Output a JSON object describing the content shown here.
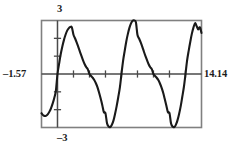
{
  "plot": {
    "title": "",
    "labels": {
      "y_max": "3",
      "y_min": "–3",
      "x_min": "–1.57",
      "x_max": "14.14"
    },
    "colors": {
      "background": "#ffffff",
      "frame": "#808080",
      "axis": "#4a4a4a",
      "curve": "#1a1a1a",
      "text": "#1c1c1c"
    }
  },
  "chart_data": {
    "type": "line",
    "title": "",
    "xlabel": "",
    "ylabel": "",
    "xlim": [
      -1.57,
      14.14
    ],
    "ylim": [
      -3,
      3
    ],
    "grid": false,
    "legend": null,
    "axis_ticks": {
      "x_tick_spacing": 1.5707963,
      "y_tick_spacing": 1,
      "x_ticks": [
        0.0,
        1.5708,
        3.1416,
        4.7124,
        6.2832,
        7.854,
        9.4248,
        10.9956,
        12.5664,
        14.1372
      ],
      "y_ticks": [
        -2,
        -1,
        1,
        2
      ]
    },
    "series": [
      {
        "name": "curve",
        "expression": "2.2*sin(x) + 0.75*sin(2*x)",
        "x": [
          -1.57,
          -1.41,
          -1.26,
          -1.1,
          -0.94,
          -0.79,
          -0.63,
          -0.47,
          -0.31,
          -0.16,
          0.0,
          0.16,
          0.31,
          0.47,
          0.63,
          0.79,
          0.94,
          1.1,
          1.26,
          1.41,
          1.57,
          1.73,
          1.88,
          2.04,
          2.2,
          2.36,
          2.51,
          2.67,
          2.83,
          2.98,
          3.14,
          3.3,
          3.46,
          3.61,
          3.77,
          3.93,
          4.08,
          4.24,
          4.4,
          4.55,
          4.71,
          4.87,
          5.03,
          5.18,
          5.34,
          5.5,
          5.65,
          5.81,
          5.97,
          6.13,
          6.28,
          6.44,
          6.6,
          6.75,
          6.91,
          7.07,
          7.23,
          7.38,
          7.54,
          7.7,
          7.85,
          8.01,
          8.17,
          8.33,
          8.48,
          8.64,
          8.8,
          8.95,
          9.11,
          9.27,
          9.42,
          9.58,
          9.74,
          9.9,
          10.05,
          10.21,
          10.37,
          10.52,
          10.68,
          10.84,
          11.0,
          11.15,
          11.31,
          11.47,
          11.62,
          11.78,
          11.94,
          12.1,
          12.25,
          12.41,
          12.57,
          12.72,
          12.88,
          13.04,
          13.19,
          13.35,
          13.51,
          13.67,
          13.82,
          13.98,
          14.14
        ],
        "y": [
          -2.2,
          -2.31,
          -2.35,
          -2.33,
          -2.25,
          -2.11,
          -1.91,
          -1.65,
          -1.33,
          -0.95,
          0.0,
          0.58,
          1.09,
          1.53,
          1.9,
          2.2,
          2.42,
          2.56,
          2.63,
          2.62,
          2.2,
          1.99,
          1.77,
          1.52,
          1.26,
          1.0,
          0.76,
          0.55,
          0.38,
          0.26,
          0.0,
          -0.11,
          -0.21,
          -0.34,
          -0.52,
          -0.75,
          -1.04,
          -1.38,
          -1.75,
          -2.14,
          -2.2,
          -2.78,
          -2.95,
          -2.97,
          -2.85,
          -2.6,
          -2.24,
          -1.8,
          -1.29,
          -0.73,
          0.0,
          0.74,
          1.3,
          1.81,
          2.25,
          2.6,
          2.85,
          2.99,
          3.0,
          2.9,
          2.2,
          1.99,
          1.77,
          1.52,
          1.26,
          1.0,
          0.76,
          0.55,
          0.38,
          0.26,
          0.0,
          -0.11,
          -0.21,
          -0.34,
          -0.52,
          -0.75,
          -1.04,
          -1.38,
          -1.75,
          -2.14,
          -2.2,
          -2.78,
          -2.95,
          -2.97,
          -2.85,
          -2.6,
          -2.24,
          -1.8,
          -1.29,
          -0.73,
          0.0,
          0.74,
          1.3,
          1.81,
          2.25,
          2.6,
          2.85,
          2.68,
          2.5,
          2.62,
          2.3
        ]
      }
    ]
  }
}
